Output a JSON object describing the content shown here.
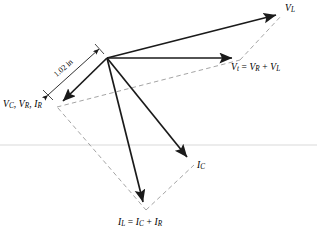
{
  "figure": {
    "background_color": "#ffffff",
    "stroke_color": "#1a1a1a",
    "dashed_color": "#8c8c8c",
    "rule_color": "#e3e3e3",
    "width": 317,
    "height": 238
  },
  "labels": {
    "v_l": {
      "symbol": "V",
      "sub": "L",
      "text": "V_L"
    },
    "v_t_sum": {
      "text": "V_t = V_R + V_L",
      "lhs_symbol": "V",
      "lhs_sub": "t",
      "term1_symbol": "V",
      "term1_sub": "R",
      "operator": "+",
      "term2_symbol": "V",
      "term2_sub": "L"
    },
    "v_c_v_r_i_r": {
      "text": "V_C, V_R, I_R",
      "part1_symbol": "V",
      "part1_sub": "C",
      "part2_symbol": "V",
      "part2_sub": "R",
      "part3_symbol": "I",
      "part3_sub": "R"
    },
    "i_c": {
      "symbol": "I",
      "sub": "C",
      "text": "I_C"
    },
    "i_l_sum": {
      "text": "I_L = I_C + I_R",
      "lhs_symbol": "I",
      "lhs_sub": "L",
      "term1_symbol": "I",
      "term1_sub": "C",
      "operator": "+",
      "term2_symbol": "I",
      "term2_sub": "R"
    },
    "dimension": {
      "value": "1.02",
      "unit": "in",
      "text": "1.02 in"
    },
    "equals": "=",
    "comma": ","
  },
  "geometry": {
    "origin": {
      "x": 107,
      "y": 58
    },
    "tips": {
      "v_l": {
        "x": 281,
        "y": 13
      },
      "v_t": {
        "x": 239,
        "y": 58
      },
      "v_c_v_r_i_r": {
        "x": 57,
        "y": 106
      },
      "i_c": {
        "x": 193,
        "y": 163
      },
      "i_l": {
        "x": 145,
        "y": 209
      }
    },
    "dimension_line": {
      "x1": 46,
      "y1": 97,
      "x2": 100,
      "y2": 48
    },
    "horizontal_rule_y": 145
  }
}
